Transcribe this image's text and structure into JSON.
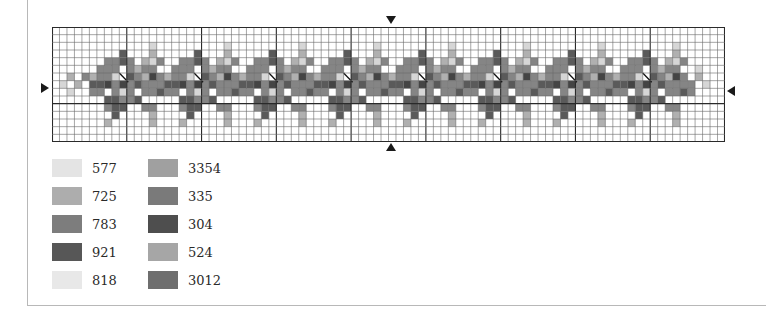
{
  "chart_title": "",
  "grid": {
    "cols": 90,
    "rows": 15,
    "major_every": 10,
    "motif_period": 10,
    "motif_start_col": 5,
    "motif_count": 8,
    "motif_rows": [
      "..........",
      "..........",
      "........p.",
      "....d...l.",
      "..mmdm.lpm",
      ".mmm.mlmm.",
      "lmmp.dmlkm",
      "ddkmkmdmmm",
      "mm.mpm.mmd",
      "..ddmmd...",
      "..mdd..mm.",
      "...d....l.",
      "..l.....l.",
      "..........",
      ".........."
    ],
    "lead_cells": [
      [
        7,
        1,
        "p"
      ],
      [
        6,
        2,
        "l"
      ],
      [
        7,
        3,
        "l"
      ],
      [
        8,
        2,
        "p"
      ],
      [
        6,
        4,
        "m"
      ]
    ],
    "tail_cells": [
      [
        6,
        86,
        "l"
      ],
      [
        7,
        87,
        "p"
      ],
      [
        5,
        86,
        "p"
      ],
      [
        7,
        85,
        "m"
      ],
      [
        8,
        85,
        "m"
      ]
    ]
  },
  "markers": {
    "top_label": "",
    "bottom_label": "",
    "left_label": "",
    "right_label": ""
  },
  "legend": {
    "left": [
      {
        "code": "577",
        "color": "#e4e4e4"
      },
      {
        "code": "725",
        "color": "#adadad"
      },
      {
        "code": "783",
        "color": "#7d7d7d"
      },
      {
        "code": "921",
        "color": "#575757"
      },
      {
        "code": "818",
        "color": "#e8e8e8"
      }
    ],
    "right": [
      {
        "code": "3354",
        "color": "#a0a0a0"
      },
      {
        "code": "335",
        "color": "#7a7a7a"
      },
      {
        "code": "304",
        "color": "#4e4e4e"
      },
      {
        "code": "524",
        "color": "#a6a6a6"
      },
      {
        "code": "3012",
        "color": "#6e6e6e"
      }
    ]
  },
  "colors": {
    "d": "#5a5a5a",
    "k": "#444444",
    "m": "#858585",
    "l": "#b0b0b0",
    "p": "#d6d6d6",
    "grid_minor": "#6a6a6a",
    "grid_major": "#2a2a2a"
  }
}
